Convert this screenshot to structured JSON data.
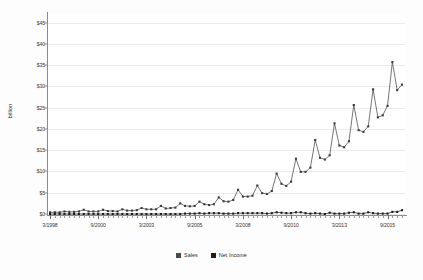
{
  "chart_data": {
    "type": "line",
    "title": "",
    "xlabel": "",
    "ylabel": "billion",
    "ylim": [
      0,
      47
    ],
    "ytick_labels": [
      "$0",
      "$5",
      "$10",
      "$15",
      "$20",
      "$25",
      "$30",
      "$35",
      "$40",
      "$45"
    ],
    "ytick_values": [
      0,
      5,
      10,
      15,
      20,
      25,
      30,
      35,
      40,
      45
    ],
    "grid": true,
    "legend_position": "bottom-center",
    "x_tick_label_every": 10,
    "xtick_labels": [
      "3/1998",
      "9/2000",
      "3/2003",
      "9/2005",
      "3/2008",
      "9/2010",
      "3/2013",
      "9/2015"
    ],
    "x": [
      "3/1998",
      "6/1998",
      "9/1998",
      "12/1998",
      "3/1999",
      "6/1999",
      "9/1999",
      "12/1999",
      "3/2000",
      "6/2000",
      "9/2000",
      "12/2000",
      "3/2001",
      "6/2001",
      "9/2001",
      "12/2001",
      "3/2002",
      "6/2002",
      "9/2002",
      "12/2002",
      "3/2003",
      "6/2003",
      "9/2003",
      "12/2003",
      "3/2004",
      "6/2004",
      "9/2004",
      "12/2004",
      "3/2005",
      "6/2005",
      "9/2005",
      "12/2005",
      "3/2006",
      "6/2006",
      "9/2006",
      "12/2006",
      "3/2007",
      "6/2007",
      "9/2007",
      "12/2007",
      "3/2008",
      "6/2008",
      "9/2008",
      "12/2008",
      "3/2009",
      "6/2009",
      "9/2009",
      "12/2009",
      "3/2010",
      "6/2010",
      "9/2010",
      "12/2010",
      "3/2011",
      "6/2011",
      "9/2011",
      "12/2011",
      "3/2012",
      "6/2012",
      "9/2012",
      "12/2012",
      "3/2013",
      "6/2013",
      "9/2013",
      "12/2013",
      "3/2014",
      "6/2014",
      "9/2014",
      "12/2014",
      "3/2015",
      "6/2015",
      "9/2015",
      "12/2015",
      "3/2016",
      "6/2016"
    ],
    "series": [
      {
        "name": "Sales",
        "color": "#3b3b3b",
        "values": [
          0.4,
          0.4,
          0.4,
          0.6,
          0.5,
          0.5,
          0.6,
          1.0,
          0.6,
          0.6,
          0.6,
          1.0,
          0.7,
          0.7,
          0.6,
          1.1,
          0.8,
          0.8,
          0.9,
          1.4,
          1.1,
          1.1,
          1.1,
          1.9,
          1.3,
          1.4,
          1.5,
          2.5,
          1.9,
          1.8,
          1.9,
          2.9,
          2.3,
          2.1,
          2.3,
          3.9,
          3.0,
          2.9,
          3.3,
          5.7,
          4.1,
          4.1,
          4.3,
          6.7,
          4.9,
          4.7,
          5.4,
          9.5,
          7.1,
          6.6,
          7.6,
          13.0,
          9.9,
          9.9,
          10.9,
          17.4,
          13.2,
          12.8,
          13.8,
          21.3,
          16.1,
          15.7,
          17.1,
          25.6,
          19.7,
          19.3,
          20.6,
          29.3,
          22.7,
          23.2,
          25.4,
          35.7,
          29.1,
          30.4
        ]
      },
      {
        "name": "Net Income",
        "color": "#1c1c1c",
        "values": [
          0.0,
          0.0,
          0.0,
          0.0,
          0.0,
          0.0,
          0.0,
          0.0,
          0.0,
          0.0,
          0.0,
          0.0,
          0.0,
          0.0,
          0.0,
          0.0,
          0.0,
          0.0,
          0.0,
          0.0,
          0.0,
          0.0,
          0.0,
          0.0,
          0.0,
          0.0,
          0.0,
          0.0,
          0.1,
          0.1,
          0.1,
          0.2,
          0.1,
          0.2,
          0.2,
          0.2,
          0.1,
          0.1,
          0.1,
          0.2,
          0.2,
          0.2,
          0.2,
          0.2,
          0.2,
          0.1,
          0.2,
          0.4,
          0.3,
          0.2,
          0.2,
          0.4,
          0.4,
          0.2,
          0.1,
          0.2,
          0.1,
          0.0,
          0.3,
          0.1,
          0.1,
          0.1,
          0.3,
          0.4,
          0.1,
          0.1,
          0.4,
          0.2,
          0.1,
          0.1,
          0.1,
          0.5,
          0.5,
          0.9
        ]
      }
    ]
  },
  "legend": {
    "items": [
      {
        "label": "Sales",
        "color": "#4a4a4a"
      },
      {
        "label": "Net Income",
        "color": "#1c1c1c"
      }
    ]
  }
}
